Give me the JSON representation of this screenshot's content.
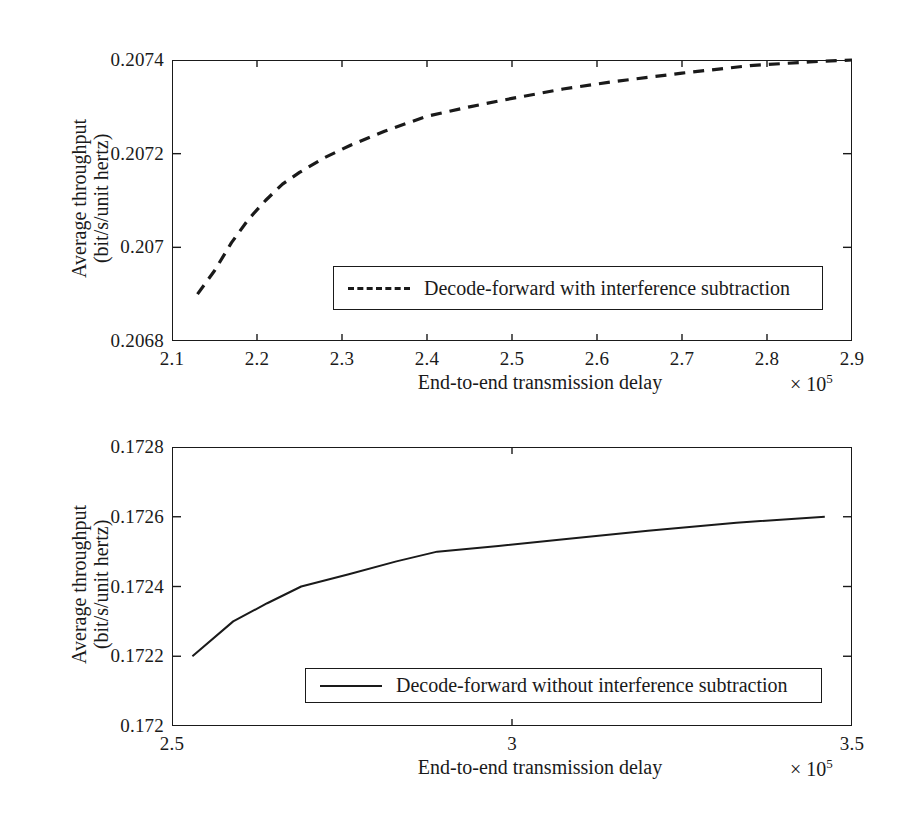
{
  "figure": {
    "background": "#ffffff",
    "ink_color": "#1a1a1a"
  },
  "chart_data": [
    {
      "id": "top",
      "type": "line",
      "title": "",
      "subtitle": "",
      "xlabel": "End-to-end transmission delay",
      "x_exponent_label": "× 10",
      "x_exponent_sup": "5",
      "ylabel_line1": "Average throughput",
      "ylabel_line2": "(bit/s/unit hertz)",
      "xlim": [
        2.1,
        2.9
      ],
      "ylim": [
        0.2068,
        0.2074
      ],
      "xticks": [
        2.1,
        2.2,
        2.3,
        2.4,
        2.5,
        2.6,
        2.7,
        2.8,
        2.9
      ],
      "xticklabels": [
        "2.1",
        "2.2",
        "2.3",
        "2.4",
        "2.5",
        "2.6",
        "2.7",
        "2.8",
        "2.9"
      ],
      "yticks": [
        0.2068,
        0.207,
        0.2072,
        0.2074
      ],
      "yticklabels": [
        "0.2068",
        "0.207",
        "0.2072",
        "0.2074"
      ],
      "grid": false,
      "legend_position": "lower-center-right",
      "series": [
        {
          "name": "Decode-forward with interference subtraction",
          "style": "dashed",
          "color": "#1a1a1a",
          "x": [
            2.13,
            2.15,
            2.17,
            2.19,
            2.21,
            2.23,
            2.25,
            2.28,
            2.31,
            2.35,
            2.4,
            2.45,
            2.5,
            2.56,
            2.62,
            2.7,
            2.78,
            2.85,
            2.9
          ],
          "y": [
            0.2069,
            0.20695,
            0.20701,
            0.20706,
            0.2071,
            0.207135,
            0.20716,
            0.207192,
            0.207218,
            0.207248,
            0.20728,
            0.2073,
            0.207318,
            0.207338,
            0.207354,
            0.207372,
            0.207388,
            0.207396,
            0.2074
          ]
        }
      ]
    },
    {
      "id": "bottom",
      "type": "line",
      "title": "",
      "subtitle": "",
      "xlabel": "End-to-end transmission delay",
      "x_exponent_label": "× 10",
      "x_exponent_sup": "5",
      "ylabel_line1": "Average throughput",
      "ylabel_line2": "(bit/s/unit hertz)",
      "xlim": [
        2.5,
        3.5
      ],
      "ylim": [
        0.172,
        0.1728
      ],
      "xticks": [
        2.5,
        3.0,
        3.5
      ],
      "xticklabels": [
        "2.5",
        "3",
        "3.5"
      ],
      "yticks": [
        0.172,
        0.1722,
        0.1724,
        0.1726,
        0.1728
      ],
      "yticklabels": [
        "0.172",
        "0.1722",
        "0.1724",
        "0.1726",
        "0.1728"
      ],
      "grid": false,
      "legend_position": "lower-center-right",
      "series": [
        {
          "name": "Decode-forward without interference subtraction",
          "style": "solid",
          "color": "#1a1a1a",
          "x": [
            2.53,
            2.59,
            2.64,
            2.69,
            2.76,
            2.83,
            2.89,
            2.98,
            3.08,
            3.2,
            3.33,
            3.46
          ],
          "y": [
            0.1722,
            0.1723,
            0.172352,
            0.1724,
            0.172435,
            0.172472,
            0.1725,
            0.172516,
            0.172536,
            0.17256,
            0.172583,
            0.1726
          ]
        }
      ]
    }
  ]
}
